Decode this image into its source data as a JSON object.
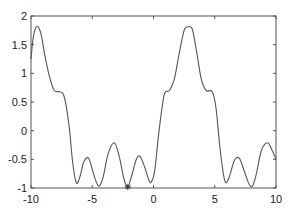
{
  "chart_data": {
    "type": "line",
    "title": "",
    "xlabel": "",
    "ylabel": "",
    "xlim": [
      -10,
      10
    ],
    "ylim": [
      -1,
      2
    ],
    "grid": false,
    "legend": null,
    "x_ticks": [
      -10,
      -5,
      0,
      5,
      10
    ],
    "y_ticks": [
      -1,
      -0.5,
      0,
      0.5,
      1,
      1.5,
      2
    ],
    "x_tick_labels": [
      "-10",
      "-5",
      "0",
      "5",
      "10"
    ],
    "y_tick_labels": [
      "-1",
      "-0.5",
      "0",
      "0.5",
      "1",
      "1.5",
      "2"
    ],
    "series": [
      {
        "name": "f(x)",
        "color": "#555555",
        "x": [
          -10,
          -9.8,
          -9.5,
          -9.2,
          -8.9,
          -8.5,
          -8.1,
          -7.7,
          -7.3,
          -6.9,
          -6.6,
          -6.3,
          -6.0,
          -5.7,
          -5.3,
          -4.9,
          -4.6,
          -4.4,
          -4.1,
          -3.7,
          -3.2,
          -2.8,
          -2.4,
          -2.1,
          -1.8,
          -1.4,
          -1.1,
          -0.7,
          -0.4,
          -0.2,
          0.1,
          0.4,
          0.8,
          1.0,
          1.3,
          1.7,
          2.1,
          2.5,
          2.8,
          3.0,
          3.2,
          3.5,
          3.9,
          4.3,
          4.8,
          5.1,
          5.4,
          5.7,
          5.9,
          6.2,
          6.6,
          7.0,
          7.4,
          7.8,
          8.1,
          8.4,
          8.8,
          9.3,
          9.7,
          10
        ],
        "y": [
          1.25,
          1.65,
          1.82,
          1.7,
          1.35,
          0.95,
          0.7,
          0.68,
          0.6,
          0.1,
          -0.55,
          -0.91,
          -0.8,
          -0.55,
          -0.48,
          -0.75,
          -0.93,
          -0.96,
          -0.8,
          -0.4,
          -0.21,
          -0.45,
          -0.85,
          -0.98,
          -0.8,
          -0.5,
          -0.45,
          -0.65,
          -0.85,
          -0.9,
          -0.7,
          -0.1,
          0.55,
          0.68,
          0.7,
          0.9,
          1.35,
          1.75,
          1.81,
          1.81,
          1.75,
          1.4,
          0.9,
          0.7,
          0.68,
          0.4,
          -0.25,
          -0.75,
          -0.91,
          -0.8,
          -0.52,
          -0.48,
          -0.7,
          -0.93,
          -0.96,
          -0.75,
          -0.35,
          -0.21,
          -0.35,
          -0.5
        ]
      }
    ],
    "markers": [
      {
        "x": -2.1,
        "y": -0.98,
        "symbol": "*",
        "label": "minimum marker"
      }
    ]
  }
}
